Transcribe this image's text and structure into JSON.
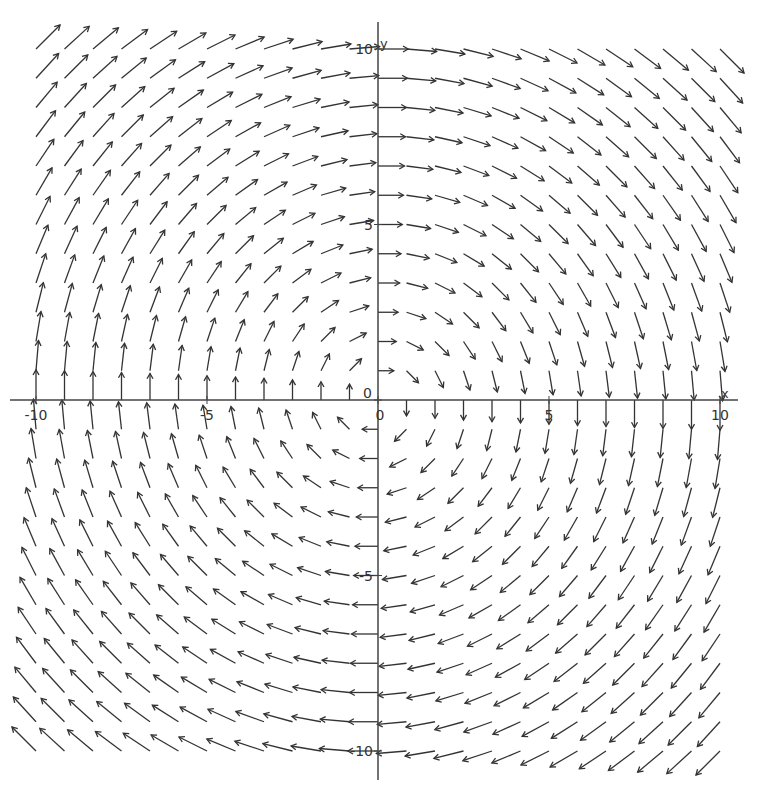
{
  "chart_data": {
    "type": "vector_field",
    "title": "",
    "field": {
      "u": "y",
      "v": "-x",
      "description": "F(x, y) = (y, -x), rotational (clockwise) field"
    },
    "xlabel": "x",
    "ylabel": "y",
    "xlim": [
      -10,
      10
    ],
    "ylim": [
      -10,
      10
    ],
    "grid": false,
    "legend": null,
    "samples_per_axis": 25,
    "x_ticks": [
      -10,
      -5,
      0,
      5,
      10
    ],
    "y_ticks": [
      -10,
      -5,
      0,
      5,
      10
    ],
    "x_tick_labels": [
      "-10",
      "-5",
      "0",
      "5",
      "10"
    ],
    "y_tick_labels": [
      "-10",
      "-5",
      "0",
      "5",
      "10"
    ],
    "origin_labels": [
      "0",
      "0"
    ],
    "quadrant_directions": {
      "Q1 (x>0,y>0)": "right-down",
      "Q2 (x<0,y>0)": "up-right",
      "Q3 (x<0,y<0)": "up-left",
      "Q4 (x>0,y<0)": "down-left",
      "positive x-axis": "down",
      "negative x-axis": "up",
      "positive y-axis": "right",
      "negative y-axis": "left"
    },
    "colors": {
      "arrow": "#333333",
      "axis": "#444444",
      "background": "#ffffff"
    }
  },
  "axes": {
    "x_name": "x",
    "y_name": "y"
  }
}
